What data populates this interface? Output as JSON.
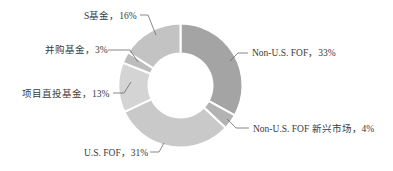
{
  "chart_data": {
    "type": "pie",
    "variant": "donut",
    "title": "",
    "start_angle_deg": 0,
    "direction": "clockwise",
    "center": [
      180.5,
      85.5
    ],
    "outer_radius": 62,
    "inner_radius": 32,
    "slices": [
      {
        "name": "Non-U.S. FOF",
        "value": 33,
        "label": "Non-U.S. FOF，33%",
        "color": "#a4a4a4",
        "label_pos": [
          252,
          56
        ],
        "anchor": "start",
        "leader": [
          [
            230,
            61
          ],
          [
            238,
            53
          ],
          [
            248,
            53
          ]
        ]
      },
      {
        "name": "Non-U.S. FOF 新兴市场",
        "value": 4,
        "label": "Non-U.S. FOF 新兴市场，4%",
        "color": "#b3b3b3",
        "label_pos": [
          253,
          132
        ],
        "anchor": "start",
        "leader": [
          [
            227,
            119
          ],
          [
            236,
            128
          ],
          [
            249,
            128
          ]
        ]
      },
      {
        "name": "U.S. FOF",
        "value": 31,
        "label": "U.S. FOF，31%",
        "color": "#c9c9c9",
        "label_pos": [
          84,
          156
        ],
        "anchor": "start",
        "leader": [
          [
            164,
            143
          ],
          [
            159,
            152
          ],
          [
            150,
            152
          ]
        ]
      },
      {
        "name": "项目直投基金",
        "value": 13,
        "label": "项目直投基金，13%",
        "color": "#d4d4d4",
        "label_pos": [
          22,
          97
        ],
        "anchor": "start",
        "leader": [
          [
            131,
            82
          ],
          [
            124,
            93
          ],
          [
            113,
            93
          ]
        ]
      },
      {
        "name": "并购基金",
        "value": 3,
        "label": "并购基金，3%",
        "color": "#bdbdbd",
        "label_pos": [
          45,
          53
        ],
        "anchor": "start",
        "leader": [
          [
            138,
            62
          ],
          [
            130,
            50
          ],
          [
            108,
            50
          ]
        ]
      },
      {
        "name": "S基金",
        "value": 16,
        "label": "S基金，16%",
        "color": "#c3c3c3",
        "label_pos": [
          84,
          19
        ],
        "anchor": "start",
        "leader": [
          [
            156,
            35
          ],
          [
            148,
            15
          ],
          [
            140,
            15
          ]
        ]
      }
    ],
    "legend": "none"
  }
}
